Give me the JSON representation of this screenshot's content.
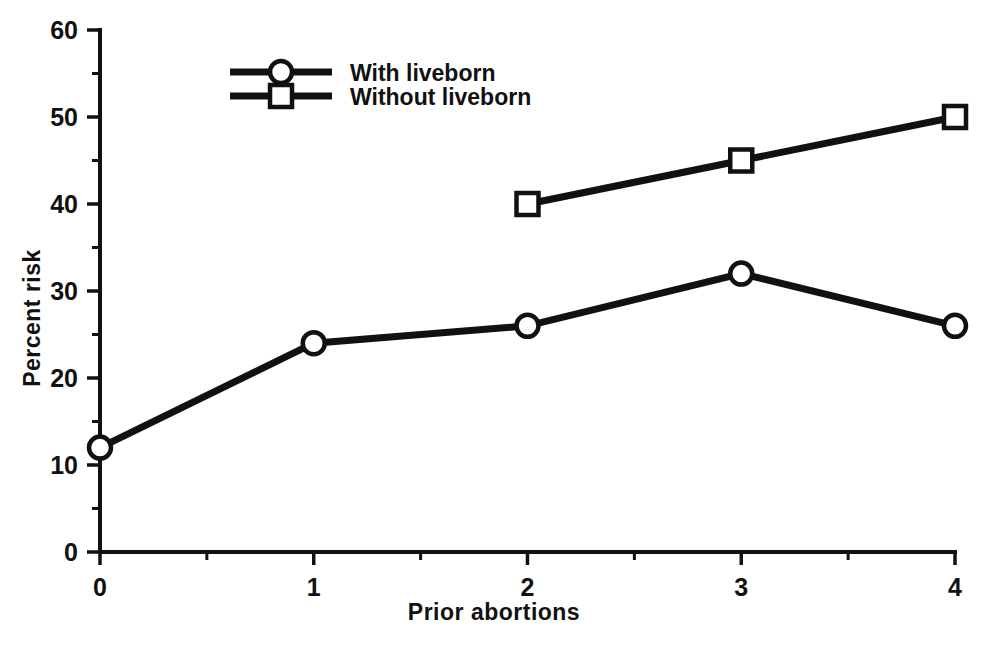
{
  "chart_data": {
    "type": "line",
    "title": "",
    "xlabel": "Prior abortions",
    "ylabel": "Percent risk",
    "x": [
      0,
      1,
      2,
      3,
      4
    ],
    "xlim": [
      0,
      4
    ],
    "ylim": [
      0,
      60
    ],
    "xticks": [
      "0",
      "1",
      "2",
      "3",
      "4"
    ],
    "yticks": [
      "0",
      "10",
      "20",
      "30",
      "40",
      "50",
      "60"
    ],
    "xtick_values": [
      0,
      1,
      2,
      3,
      4
    ],
    "ytick_values": [
      0,
      10,
      20,
      30,
      40,
      50,
      60
    ],
    "xminor_step": 0.5,
    "yminor_step": 5,
    "grid": false,
    "legend_position": "upper-left-inside",
    "series": [
      {
        "name": "With liveborn",
        "marker": "circle",
        "x": [
          0,
          1,
          2,
          3,
          4
        ],
        "values": [
          12,
          24,
          26,
          32,
          26
        ]
      },
      {
        "name": "Without liveborn",
        "marker": "square",
        "x": [
          2,
          3,
          4
        ],
        "values": [
          40,
          45,
          50
        ]
      }
    ],
    "colors": {
      "line": "#111111",
      "marker_fill": "#ffffff",
      "background": "#ffffff"
    }
  },
  "legend": {
    "items": [
      {
        "label": "With liveborn",
        "marker": "circle-marker-icon"
      },
      {
        "label": "Without liveborn",
        "marker": "square-marker-icon"
      }
    ]
  },
  "axes": {
    "x_title": "Prior abortions",
    "y_title": "Percent risk",
    "x_tick_labels": [
      "0",
      "1",
      "2",
      "3",
      "4"
    ],
    "y_tick_labels": [
      "0",
      "10",
      "20",
      "30",
      "40",
      "50",
      "60"
    ]
  }
}
